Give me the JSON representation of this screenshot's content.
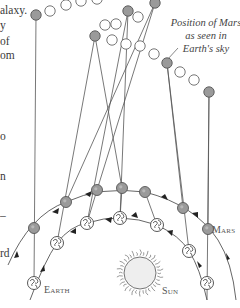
{
  "left_text_fragments": [
    {
      "text": "alaxy.",
      "x": 0,
      "y": 5
    },
    {
      "text": "y",
      "x": 0,
      "y": 20
    },
    {
      "text": " of",
      "x": 0,
      "y": 36
    },
    {
      "text": "om",
      "x": 0,
      "y": 50
    },
    {
      "text": "o",
      "x": 0,
      "y": 131
    },
    {
      "text": "n",
      "x": 0,
      "y": 171
    },
    {
      "text": "–",
      "x": 0,
      "y": 210
    },
    {
      "text": "rd",
      "x": 0,
      "y": 248
    }
  ],
  "caption": {
    "lines": [
      "Position of Mars",
      "as seen in",
      "Earth's sky"
    ]
  },
  "labels": {
    "mars": "Mars",
    "earth": "Earth",
    "sun": "Sun"
  },
  "colors": {
    "line": "#555555",
    "planet_fill": "#9a9a9a",
    "planet_stroke": "#555555",
    "open_circle_stroke": "#666666",
    "sun_fill": "#eeeeee",
    "text": "#3a3a3a"
  },
  "sky_positions": [
    {
      "x": 36,
      "y": 15,
      "filled": true
    },
    {
      "x": 50,
      "y": 11,
      "filled": false
    },
    {
      "x": 66,
      "y": 5,
      "filled": false
    },
    {
      "x": 81,
      "y": 1,
      "filled": false
    },
    {
      "x": 97,
      "y": -1,
      "filled": false
    },
    {
      "x": 128,
      "y": 11,
      "filled": true
    },
    {
      "x": 138,
      "y": 17,
      "filled": false
    },
    {
      "x": 105,
      "y": 25,
      "filled": false
    },
    {
      "x": 116,
      "y": 24,
      "filled": false
    },
    {
      "x": 95,
      "y": 36,
      "filled": true
    },
    {
      "x": 112,
      "y": 40,
      "filled": false
    },
    {
      "x": 126,
      "y": 44,
      "filled": false
    },
    {
      "x": 140,
      "y": 46,
      "filled": false
    },
    {
      "x": 155,
      "y": 3,
      "filled": true
    },
    {
      "x": 154,
      "y": 54,
      "filled": false
    },
    {
      "x": 167,
      "y": 63,
      "filled": true
    },
    {
      "x": 180,
      "y": 72,
      "filled": false
    },
    {
      "x": 194,
      "y": 80,
      "filled": false
    },
    {
      "x": 209,
      "y": 92,
      "filled": true
    }
  ],
  "mars_orbit_points": [
    {
      "x": 34,
      "y": 228
    },
    {
      "x": 66,
      "y": 202
    },
    {
      "x": 97,
      "y": 190
    },
    {
      "x": 122,
      "y": 188
    },
    {
      "x": 145,
      "y": 192
    },
    {
      "x": 183,
      "y": 208
    },
    {
      "x": 208,
      "y": 229
    }
  ],
  "earth_orbit_points": [
    {
      "x": 34,
      "y": 283
    },
    {
      "x": 57,
      "y": 243
    },
    {
      "x": 87,
      "y": 223
    },
    {
      "x": 120,
      "y": 218
    },
    {
      "x": 157,
      "y": 225
    },
    {
      "x": 189,
      "y": 251
    },
    {
      "x": 207,
      "y": 283
    }
  ],
  "sun": {
    "x": 140,
    "y": 273,
    "r": 16
  }
}
